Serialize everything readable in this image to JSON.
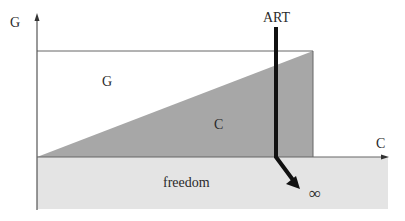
{
  "diagram": {
    "axes": {
      "y_label": "G",
      "x_label": "C"
    },
    "regions": {
      "upper_label": "G",
      "triangle_label": "C",
      "band_label": "freedom"
    },
    "arrow": {
      "label": "ART",
      "end_label": "∞"
    },
    "colors": {
      "triangle": "#a7a7a7",
      "band": "#e4e4e4",
      "lines": "#666666",
      "arrow": "#111111"
    }
  }
}
